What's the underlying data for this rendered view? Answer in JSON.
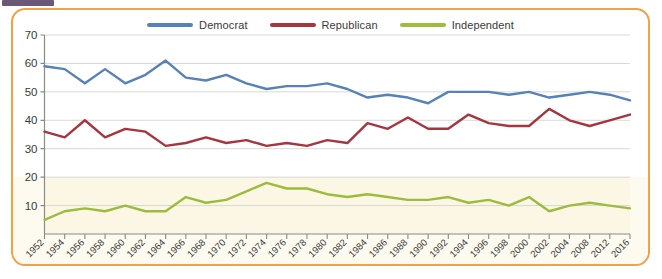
{
  "card": {
    "border_color": "#f0a24b",
    "background": "#ffffff"
  },
  "artifact": {
    "name": "cropped-banner-fragment",
    "color": "#6b5878"
  },
  "legend": {
    "position": "top-center",
    "items": [
      {
        "label": "Democrat",
        "color": "#5681b9"
      },
      {
        "label": "Republican",
        "color": "#a63540"
      },
      {
        "label": "Independent",
        "color": "#9cbb3f"
      }
    ]
  },
  "axes": {
    "y_ticks": [
      "70",
      "60",
      "50",
      "40",
      "30",
      "20",
      "10"
    ],
    "y_min": 0,
    "y_max": 70,
    "grid": true,
    "plot_bg_upper": "#ffffff",
    "plot_bg_lower": "#fbf7e4",
    "gridline_color": "#d8d8d4",
    "axis_color": "#8a8a86"
  },
  "chart_data": {
    "type": "line",
    "title": "",
    "subtitle": "",
    "xlabel": "",
    "ylabel": "",
    "ylim": [
      0,
      70
    ],
    "yticks": [
      10,
      20,
      30,
      40,
      50,
      60,
      70
    ],
    "grid": true,
    "legend_position": "top-center",
    "categories": [
      "1952",
      "1954",
      "1956",
      "1958",
      "1960",
      "1962",
      "1964",
      "1966",
      "1968",
      "1970",
      "1972",
      "1974",
      "1976",
      "1978",
      "1980",
      "1982",
      "1984",
      "1986",
      "1988",
      "1990",
      "1992",
      "1994",
      "1996",
      "1998",
      "2000",
      "2002",
      "2004",
      "2008",
      "2012",
      "2016"
    ],
    "series": [
      {
        "name": "Democrat",
        "color": "#5681b9",
        "values": [
          59,
          58,
          53,
          58,
          53,
          56,
          61,
          55,
          54,
          56,
          53,
          51,
          52,
          52,
          53,
          51,
          48,
          49,
          48,
          46,
          50,
          50,
          50,
          49,
          50,
          48,
          49,
          50,
          49,
          47
        ]
      },
      {
        "name": "Republican",
        "color": "#a63540",
        "values": [
          36,
          34,
          40,
          34,
          37,
          36,
          31,
          32,
          34,
          32,
          33,
          31,
          32,
          31,
          33,
          32,
          39,
          37,
          41,
          37,
          37,
          42,
          39,
          38,
          38,
          44,
          40,
          38,
          40,
          42
        ]
      },
      {
        "name": "Independent",
        "color": "#9cbb3f",
        "values": [
          5,
          8,
          9,
          8,
          10,
          8,
          8,
          13,
          11,
          12,
          15,
          18,
          16,
          16,
          14,
          13,
          14,
          13,
          12,
          12,
          13,
          11,
          12,
          10,
          13,
          8,
          10,
          11,
          10,
          9
        ]
      }
    ]
  }
}
